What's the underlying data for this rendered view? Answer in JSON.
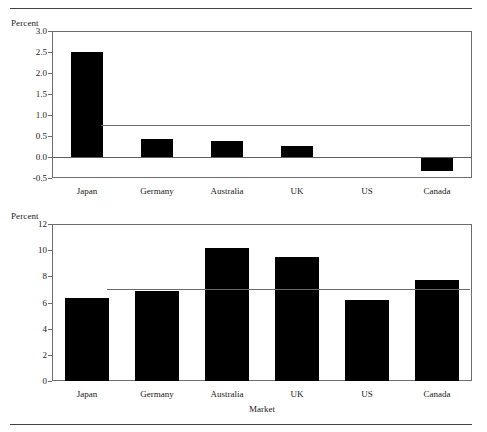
{
  "figure": {
    "top_rule": true,
    "bottom_rule": true
  },
  "panels": [
    {
      "id": "top-panel",
      "y_axis_unit": "Percent",
      "y_ticks": [
        "3.0",
        "2.5",
        "2.0",
        "1.5",
        "1.0",
        "0.5",
        "0.0",
        "-0.5"
      ],
      "x_axis_title": "",
      "categories": [
        "Japan",
        "Germany",
        "Australia",
        "UK",
        "US",
        "Canada"
      ]
    },
    {
      "id": "bottom-panel",
      "y_axis_unit": "Percent",
      "y_ticks": [
        "12",
        "10",
        "8",
        "6",
        "4",
        "2",
        "0"
      ],
      "x_axis_title": "Market",
      "categories": [
        "Japan",
        "Germany",
        "Australia",
        "UK",
        "US",
        "Canada"
      ]
    }
  ],
  "chart_data": [
    {
      "type": "bar",
      "id": "top-panel",
      "title": "",
      "xlabel": "",
      "ylabel": "Percent",
      "categories": [
        "Japan",
        "Germany",
        "Australia",
        "UK",
        "US",
        "Canada"
      ],
      "values": [
        2.5,
        0.44,
        0.39,
        0.26,
        0.0,
        -0.33
      ],
      "ylim": [
        -0.5,
        3.0
      ],
      "ytick_values": [
        3.0,
        2.5,
        2.0,
        1.5,
        1.0,
        0.5,
        0.0,
        -0.5
      ],
      "ytick_labels": [
        "3.0",
        "2.5",
        "2.0",
        "1.5",
        "1.0",
        "0.5",
        "0.0",
        "-0.5"
      ],
      "zero_line": 0.0,
      "reference_line": {
        "value": 0.76,
        "label": "",
        "starts_at_category": "Germany"
      },
      "grid": false,
      "legend": "none",
      "bar_color": "#000000"
    },
    {
      "type": "bar",
      "id": "bottom-panel",
      "title": "",
      "xlabel": "Market",
      "ylabel": "Percent",
      "categories": [
        "Japan",
        "Germany",
        "Australia",
        "UK",
        "US",
        "Canada"
      ],
      "values": [
        6.35,
        6.85,
        10.15,
        9.5,
        6.2,
        7.7
      ],
      "ylim": [
        0,
        12
      ],
      "ytick_values": [
        12,
        10,
        8,
        6,
        4,
        2,
        0
      ],
      "ytick_labels": [
        "12",
        "10",
        "8",
        "6",
        "4",
        "2",
        "0"
      ],
      "reference_line": {
        "value": 7.0,
        "label": "",
        "starts_at_category": "Germany"
      },
      "grid": false,
      "legend": "none",
      "bar_color": "#000000"
    }
  ]
}
